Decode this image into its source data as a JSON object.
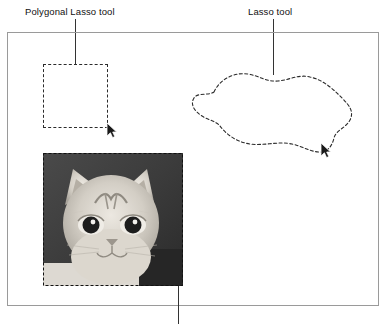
{
  "figure": {
    "labels": {
      "polygonal_lasso": "Polygonal Lasso tool",
      "lasso": "Lasso tool"
    },
    "colors": {
      "frame_border": "#9a9a9a",
      "selection_dash": "#2b2b2b",
      "leader_line": "#333333",
      "text": "#111111",
      "photo_background": "#3a3a3a",
      "photo_subject": "#d8d4cc"
    },
    "elements": {
      "polygonal_selection": "rectangular-dashed-marquee",
      "lasso_selection": "freeform-dotted-marquee",
      "photo_selection": "dashed-marquee-around-photo",
      "photo_subject": "grayscale-cat-head-photograph",
      "cursor": "arrow-pointer"
    },
    "icons": {
      "cursor_polygonal": "arrow-cursor-icon",
      "cursor_lasso": "arrow-cursor-icon"
    }
  }
}
